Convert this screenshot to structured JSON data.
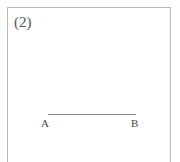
{
  "figure": {
    "index_label": "(2)",
    "panel": {
      "border_color": "#b9b9b9",
      "background_color": "#ffffff"
    },
    "geometry": {
      "type": "line-segment",
      "stroke_color": "#8a8a8a",
      "endpoints": [
        {
          "name": "A",
          "label": "A"
        },
        {
          "name": "B",
          "label": "B"
        }
      ]
    },
    "text_color": "#555555"
  }
}
